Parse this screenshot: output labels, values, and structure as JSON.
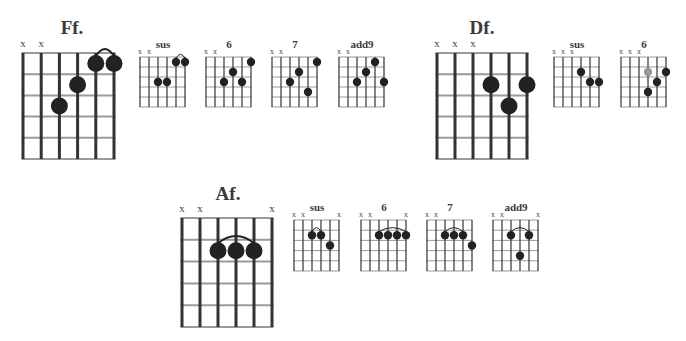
{
  "page": {
    "width": 686,
    "height": 341,
    "background": "#ffffff"
  },
  "colors": {
    "grid_string": "#333333",
    "grid_fret": "#9a9a9a",
    "dot": "#222222",
    "dot_alt": "#9a9a9a",
    "text": "#3a3a3a"
  },
  "chords": [
    {
      "id": "ff",
      "title": "Ff.",
      "size": "large",
      "x0": 23,
      "y0": 53,
      "dx": 18.2,
      "dy": 21.2,
      "title_pos": [
        72,
        34
      ],
      "muted": [
        1,
        2
      ],
      "dots": [
        [
          3,
          3
        ],
        [
          4,
          2
        ],
        [
          5,
          1
        ],
        [
          6,
          1
        ]
      ],
      "barres": [
        [
          5,
          6,
          1
        ]
      ]
    },
    {
      "id": "ff-sus",
      "title": "sus",
      "size": "small",
      "x0": 140,
      "y0": 57,
      "dx": 9,
      "dy": 10,
      "title_pos": [
        163,
        48
      ],
      "muted": [
        1,
        2
      ],
      "dots": [
        [
          3,
          3
        ],
        [
          4,
          3
        ],
        [
          5,
          1
        ],
        [
          6,
          1
        ]
      ],
      "barres": [
        [
          5,
          6,
          1
        ]
      ]
    },
    {
      "id": "ff-6",
      "title": "6",
      "size": "small",
      "x0": 206,
      "y0": 57,
      "dx": 9,
      "dy": 10,
      "title_pos": [
        229,
        48
      ],
      "muted": [
        1,
        2
      ],
      "dots": [
        [
          3,
          3
        ],
        [
          4,
          2
        ],
        [
          5,
          3
        ],
        [
          6,
          1
        ]
      ],
      "barres": []
    },
    {
      "id": "ff-7",
      "title": "7",
      "size": "small",
      "x0": 272,
      "y0": 57,
      "dx": 9,
      "dy": 10,
      "title_pos": [
        295,
        48
      ],
      "muted": [
        1,
        2
      ],
      "dots": [
        [
          3,
          3
        ],
        [
          4,
          2
        ],
        [
          5,
          4
        ],
        [
          6,
          1
        ]
      ],
      "barres": []
    },
    {
      "id": "ff-add9",
      "title": "add9",
      "size": "small",
      "x0": 339,
      "y0": 57,
      "dx": 9,
      "dy": 10,
      "title_pos": [
        362,
        48
      ],
      "muted": [
        1,
        2
      ],
      "dots": [
        [
          3,
          3
        ],
        [
          4,
          2
        ],
        [
          5,
          1
        ],
        [
          6,
          3
        ]
      ],
      "barres": []
    },
    {
      "id": "df",
      "title": "Df.",
      "size": "large",
      "x0": 437,
      "y0": 53,
      "dx": 18,
      "dy": 21.2,
      "title_pos": [
        482,
        34
      ],
      "muted": [
        1,
        2,
        3
      ],
      "dots": [
        [
          4,
          2
        ],
        [
          5,
          3
        ],
        [
          6,
          2
        ]
      ],
      "barres": []
    },
    {
      "id": "df-sus",
      "title": "sus",
      "size": "small",
      "x0": 554,
      "y0": 57,
      "dx": 9,
      "dy": 10,
      "title_pos": [
        577,
        48
      ],
      "muted": [
        1,
        2,
        3
      ],
      "dots": [
        [
          4,
          2
        ],
        [
          5,
          3
        ],
        [
          6,
          3
        ]
      ],
      "barres": []
    },
    {
      "id": "df-6",
      "title": "6",
      "size": "small",
      "x0": 621,
      "y0": 57,
      "dx": 9,
      "dy": 10,
      "title_pos": [
        644,
        48
      ],
      "muted": [
        1,
        2,
        3
      ],
      "dots": [
        [
          4,
          2,
          "alt"
        ],
        [
          4,
          4
        ],
        [
          5,
          3
        ],
        [
          6,
          2
        ]
      ],
      "barres": []
    },
    {
      "id": "af",
      "title": "Af.",
      "size": "large",
      "x0": 182,
      "y0": 218,
      "dx": 18,
      "dy": 21.8,
      "title_pos": [
        228,
        200
      ],
      "muted": [
        1,
        2,
        6
      ],
      "dots": [
        [
          3,
          2
        ],
        [
          4,
          2
        ],
        [
          5,
          2
        ]
      ],
      "barres": [
        [
          3,
          5,
          2
        ]
      ]
    },
    {
      "id": "af-sus",
      "title": "sus",
      "size": "small",
      "x0": 294,
      "y0": 220,
      "dx": 9,
      "dy": 10.2,
      "title_pos": [
        317,
        211
      ],
      "muted": [
        1,
        2,
        6
      ],
      "dots": [
        [
          3,
          2
        ],
        [
          4,
          2
        ],
        [
          5,
          3
        ]
      ],
      "barres": [
        [
          3,
          4,
          2
        ]
      ]
    },
    {
      "id": "af-6",
      "title": "6",
      "size": "small",
      "x0": 361,
      "y0": 220,
      "dx": 9,
      "dy": 10.2,
      "title_pos": [
        384,
        211
      ],
      "muted": [
        1,
        2,
        6
      ],
      "dots": [
        [
          3,
          2
        ],
        [
          4,
          2
        ],
        [
          5,
          2
        ],
        [
          6,
          2
        ]
      ],
      "barres": [
        [
          3,
          6,
          2
        ]
      ]
    },
    {
      "id": "af-7",
      "title": "7",
      "size": "small",
      "x0": 427,
      "y0": 220,
      "dx": 9,
      "dy": 10.2,
      "title_pos": [
        450,
        211
      ],
      "muted": [
        1,
        2
      ],
      "dots": [
        [
          3,
          2
        ],
        [
          4,
          2
        ],
        [
          5,
          2
        ],
        [
          6,
          3
        ]
      ],
      "barres": [
        [
          3,
          5,
          2
        ]
      ]
    },
    {
      "id": "af-add9",
      "title": "add9",
      "size": "small",
      "x0": 493,
      "y0": 220,
      "dx": 9,
      "dy": 10.2,
      "title_pos": [
        516,
        211
      ],
      "muted": [
        1,
        2,
        6
      ],
      "dots": [
        [
          3,
          2
        ],
        [
          4,
          4
        ],
        [
          5,
          2
        ]
      ],
      "barres": [
        [
          3,
          5,
          2
        ]
      ]
    }
  ]
}
